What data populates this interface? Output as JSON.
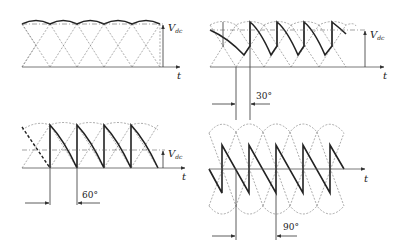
{
  "figure": {
    "panels": [
      {
        "id": "a",
        "firing_angle": "0°",
        "vdc_label": "V",
        "vdc_sub": "dc",
        "t_label": "t"
      },
      {
        "id": "b",
        "firing_angle": "30°",
        "angle_label": "30°",
        "vdc_label": "V",
        "vdc_sub": "dc",
        "t_label": "t"
      },
      {
        "id": "c",
        "firing_angle": "60°",
        "angle_label": "60°",
        "vdc_label": "V",
        "vdc_sub": "dc",
        "t_label": "t"
      },
      {
        "id": "d",
        "firing_angle": "90°",
        "angle_label": "90°",
        "t_label": "t"
      }
    ],
    "colors": {
      "waveform": "#222222",
      "dashed": "#888888",
      "axis": "#555555"
    }
  }
}
